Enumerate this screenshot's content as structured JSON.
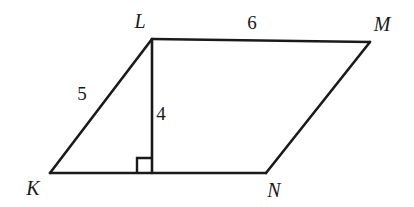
{
  "figure": {
    "type": "geometry-diagram",
    "shape": "parallelogram",
    "name": "parallelogram-KLMN",
    "stroke_color": "#1a1a1a",
    "background_color": "#ffffff",
    "stroke_width": 2.6,
    "vertices": [
      {
        "id": "K",
        "label": "K",
        "x": 50,
        "y": 173,
        "label_x": 33,
        "label_y": 188
      },
      {
        "id": "L",
        "label": "L",
        "x": 152,
        "y": 39,
        "label_x": 140,
        "label_y": 21
      },
      {
        "id": "M",
        "label": "M",
        "x": 370,
        "y": 42,
        "label_x": 382,
        "label_y": 24
      },
      {
        "id": "N",
        "label": "N",
        "x": 266,
        "y": 173,
        "label_x": 274,
        "label_y": 190
      }
    ],
    "sides": [
      {
        "name": "side-KL",
        "from": "K",
        "to": "L"
      },
      {
        "name": "side-LM",
        "from": "L",
        "to": "M"
      },
      {
        "name": "side-MN",
        "from": "M",
        "to": "N"
      },
      {
        "name": "side-NK",
        "from": "N",
        "to": "K"
      }
    ],
    "altitude": {
      "name": "altitude-L-to-base",
      "from_x": 152,
      "from_y": 39,
      "to_x": 152,
      "to_y": 173
    },
    "right_angle_marker": {
      "name": "right-angle-marker",
      "x": 137,
      "y": 158,
      "size": 15
    },
    "measure_labels": [
      {
        "name": "label-side-KL",
        "value": "5",
        "x": 82,
        "y": 93,
        "describes": "side-KL"
      },
      {
        "name": "label-altitude",
        "value": "4",
        "x": 161,
        "y": 113,
        "describes": "altitude-L-to-base"
      },
      {
        "name": "label-side-LM",
        "value": "6",
        "x": 252,
        "y": 22,
        "describes": "side-LM"
      }
    ]
  }
}
